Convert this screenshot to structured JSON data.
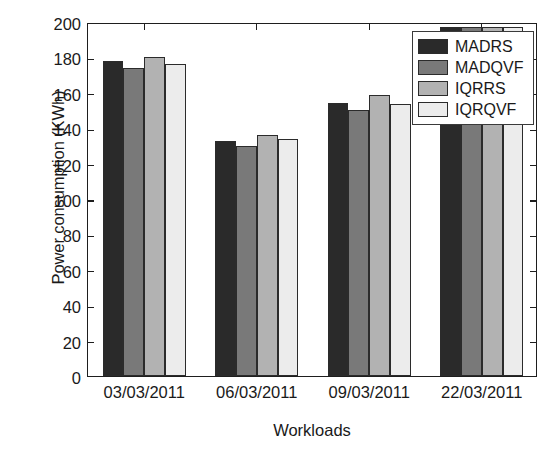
{
  "chart_data": {
    "type": "bar",
    "title": "",
    "xlabel": "Workloads",
    "ylabel": "Power consumption (KWh)",
    "categories": [
      "03/03/2011",
      "06/03/2011",
      "09/03/2011",
      "22/03/2011"
    ],
    "ylim": [
      0,
      200
    ],
    "yticks": [
      0,
      20,
      40,
      60,
      80,
      100,
      120,
      140,
      160,
      180,
      200
    ],
    "ytick_labels": [
      "0",
      "20",
      "40",
      "60",
      "80",
      "100",
      "120",
      "140",
      "160",
      "180",
      "200"
    ],
    "grid": false,
    "legend_position": "top-right",
    "series": [
      {
        "name": "MADRS",
        "color": "#2a2a2a",
        "values": [
          178,
          133,
          154.5,
          197
        ]
      },
      {
        "name": "MADQVF",
        "color": "#797979",
        "values": [
          174,
          130,
          150.5,
          197
        ]
      },
      {
        "name": "IQRRS",
        "color": "#b2b2b2",
        "values": [
          180.5,
          136,
          158.5,
          197
        ]
      },
      {
        "name": "IQRQVF",
        "color": "#ececec",
        "values": [
          176.5,
          134,
          153.5,
          197
        ]
      }
    ]
  },
  "legend": {
    "entries": [
      "MADRS",
      "MADQVF",
      "IQRRS",
      "IQRQVF"
    ]
  },
  "axes": {
    "frame_color": "#1e1e1e",
    "bar_edge_color": "#2b2b2b"
  }
}
